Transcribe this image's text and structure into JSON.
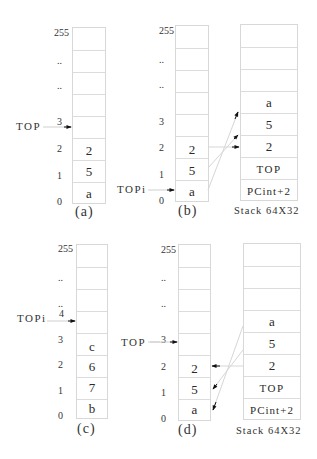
{
  "panels": {
    "a": {
      "caption": "(a)",
      "pointer_label": "TOP",
      "pointer_index": "3",
      "index_labels": [
        "255",
        "..",
        "..",
        "3",
        "2",
        "1",
        "0"
      ],
      "cells": [
        "",
        "",
        "",
        "",
        "",
        "2",
        "5",
        "a"
      ]
    },
    "b": {
      "caption": "(b)",
      "pointer_label": "TOPi",
      "pointer_index": "0",
      "index_labels": [
        "255",
        "..",
        "..",
        "3",
        "2",
        "1",
        "0"
      ],
      "cells": [
        "",
        "",
        "",
        "",
        "",
        "2",
        "5",
        "a"
      ],
      "stack": {
        "caption": "Stack 64X32",
        "cells": [
          "",
          "",
          "",
          "a",
          "5",
          "2",
          "TOP",
          "PCint+2"
        ]
      }
    },
    "c": {
      "caption": "(c)",
      "pointer_label": "TOPi",
      "pointer_index": "4",
      "index_labels": [
        "255",
        "..",
        "..",
        "4",
        "3",
        "2",
        "1",
        "0"
      ],
      "cells": [
        "",
        "",
        "",
        "",
        "c",
        "6",
        "7",
        "b"
      ]
    },
    "d": {
      "caption": "(d)",
      "pointer_label": "TOP",
      "pointer_index": "3",
      "index_labels": [
        "255",
        "..",
        "..",
        "3",
        "2",
        "1",
        "0"
      ],
      "cells": [
        "",
        "",
        "",
        "",
        "",
        "2",
        "5",
        "a"
      ],
      "stack": {
        "caption": "Stack 64X32",
        "cells": [
          "",
          "",
          "",
          "a",
          "5",
          "2",
          "TOP",
          "PCint+2"
        ]
      }
    }
  },
  "colors": {
    "grid": "#d8d8d8",
    "text": "#2a2a2a",
    "connector": "#d0d0d0",
    "arrowhead": "#111111"
  }
}
